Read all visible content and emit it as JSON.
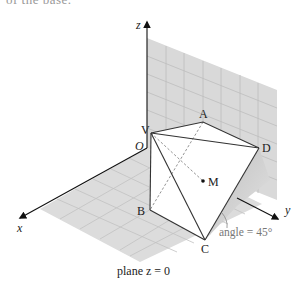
{
  "caption_fragment": "of the base.",
  "axes": {
    "x_label": "x",
    "y_label": "y",
    "z_label": "z",
    "origin_label": "O"
  },
  "points": {
    "V": "V",
    "A": "A",
    "D": "D",
    "B": "B",
    "C": "C",
    "M": "M"
  },
  "annotations": {
    "angle": "angle = 45°",
    "plane": "plane z = 0"
  },
  "colors": {
    "plane_fill": "#d9d9d9",
    "grid_line": "#bdbdbd",
    "edge": "#333333",
    "hidden_edge": "#777777",
    "face": "#ffffff",
    "shadow": "#c4c4c4"
  }
}
